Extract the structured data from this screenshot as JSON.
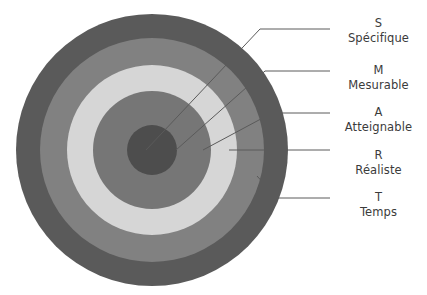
{
  "diagram": {
    "background_color": "#ffffff"
  },
  "target": {
    "name": "concentric-target",
    "center": {
      "x": 152,
      "y": 150
    },
    "rings": [
      {
        "key": "outer",
        "label_key": "T",
        "radius": 136,
        "color": "#5a5a5a"
      },
      {
        "key": "second",
        "label_key": "R",
        "radius": 112,
        "color": "#818181"
      },
      {
        "key": "third",
        "label_key": "A",
        "radius": 85,
        "color": "#d6d6d6"
      },
      {
        "key": "fourth",
        "label_key": "M",
        "radius": 59,
        "color": "#767676"
      },
      {
        "key": "center",
        "label_key": "S",
        "radius": 25,
        "color": "#4d4d4d"
      }
    ]
  },
  "leaders": {
    "color": "#5a5a5a",
    "lines": [
      {
        "name": "leader-s",
        "points": "146,150 260,29 330,29"
      },
      {
        "name": "leader-m",
        "points": "176,150 265,71 330,71"
      },
      {
        "name": "leader-a",
        "points": "203,150 272,113 330,113"
      },
      {
        "name": "leader-r",
        "points": "229,150 330,150"
      },
      {
        "name": "leader-t",
        "points": "257,176 277,198 330,198"
      }
    ]
  },
  "legend": {
    "entries": [
      {
        "letter": "S",
        "word": "Spécifique"
      },
      {
        "letter": "M",
        "word": "Mesurable"
      },
      {
        "letter": "A",
        "word": "Atteignable"
      },
      {
        "letter": "R",
        "word": "Réaliste"
      },
      {
        "letter": "T",
        "word": "Temps"
      }
    ]
  },
  "colors": {
    "text": "#3b3b3b",
    "leader": "#5a5a5a",
    "ring_outer": "#5a5a5a",
    "ring_second": "#818181",
    "ring_third": "#d6d6d6",
    "ring_fourth": "#767676",
    "ring_center": "#4d4d4d"
  }
}
